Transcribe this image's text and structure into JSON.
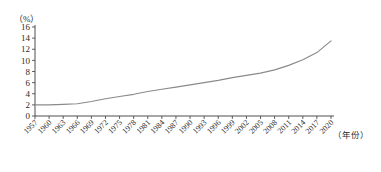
{
  "chart_data": {
    "type": "line",
    "title": "",
    "subtitle": "",
    "xlabel": "(年份)",
    "ylabel": "(%)",
    "ylim": [
      0,
      16
    ],
    "xlim": [
      1957,
      2020
    ],
    "grid": false,
    "legend": null,
    "y_ticks": [
      0,
      2,
      4,
      6,
      8,
      10,
      12,
      14,
      16
    ],
    "x_ticks": [
      1957,
      1960,
      1963,
      1966,
      1969,
      1972,
      1975,
      1978,
      1981,
      1984,
      1987,
      1990,
      1993,
      1996,
      1999,
      2002,
      2005,
      2008,
      2011,
      2014,
      2017,
      2020
    ],
    "series": [
      {
        "name": "",
        "color": "#8a8a8a",
        "x": [
          1957,
          1960,
          1963,
          1966,
          1969,
          1972,
          1975,
          1978,
          1981,
          1984,
          1987,
          1990,
          1993,
          1996,
          1999,
          2002,
          2005,
          2008,
          2011,
          2014,
          2017,
          2020
        ],
        "values": [
          2.0,
          2.0,
          2.1,
          2.2,
          2.6,
          3.1,
          3.5,
          3.9,
          4.4,
          4.8,
          5.2,
          5.6,
          6.0,
          6.4,
          6.9,
          7.3,
          7.7,
          8.3,
          9.1,
          10.1,
          11.4,
          13.5
        ]
      }
    ]
  },
  "axis": {
    "y_unit": "（%）",
    "x_unit": "（年份）",
    "y_tick_labels": [
      "16",
      "14",
      "12",
      "10",
      "8",
      "6",
      "4",
      "2",
      "0"
    ],
    "x_tick_labels": [
      "1957",
      "1960",
      "1963",
      "1966",
      "1969",
      "1972",
      "1975",
      "1978",
      "1981",
      "1984",
      "1987",
      "1990",
      "1993",
      "1996",
      "1999",
      "2002",
      "2005",
      "2008",
      "2011",
      "2014",
      "2017",
      "2020"
    ]
  },
  "colors": {
    "line": "#8a8a8a",
    "axis": "#3a3a3a",
    "text": "#2b2b2b",
    "background": "#ffffff"
  }
}
